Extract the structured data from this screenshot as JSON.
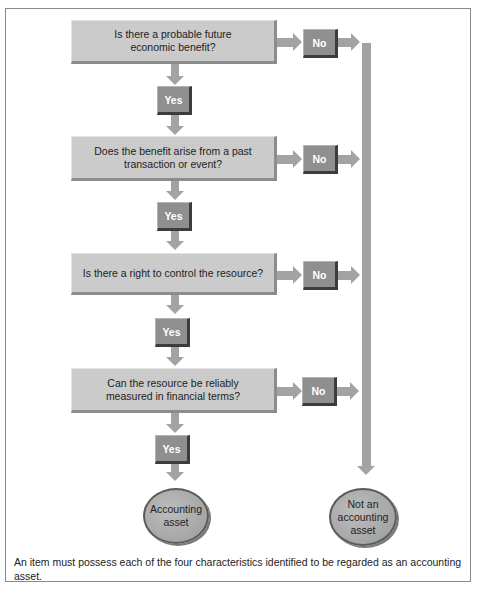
{
  "diagram": {
    "questions": [
      {
        "label": "Is there a probable future economic benefit?"
      },
      {
        "label": "Does the benefit arise from a past transaction or event?"
      },
      {
        "label": "Is there a right to control the resource?"
      },
      {
        "label": "Can the resource be reliably measured in financial terms?"
      }
    ],
    "yes_label": "Yes",
    "no_label": "No",
    "outcomes": {
      "positive": "Accounting asset",
      "negative": "Not an accounting asset"
    },
    "caption": "An item must possess each of the four characteristics identified to be regarded as an accounting asset.",
    "colors": {
      "question_box": "#c9c9c9",
      "answer_box": "#8f8f8f",
      "connector": "#a3a3a3",
      "frame_border": "#8a8a8a"
    }
  }
}
